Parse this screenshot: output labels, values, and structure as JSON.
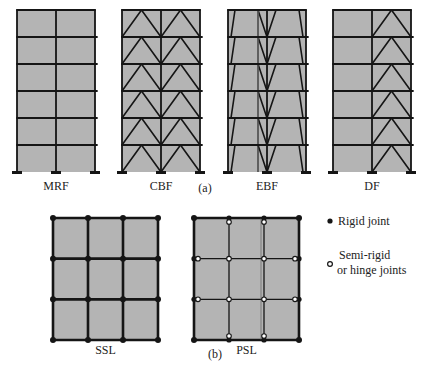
{
  "colors": {
    "panel_fill": "#b4b4b4",
    "member": "#151515",
    "rigid_joint": "#151515",
    "hinge_joint_fill": "#ffffff"
  },
  "part_a": {
    "label": "(a)",
    "frames": [
      {
        "id": "mrf",
        "label": "MRF",
        "stories": 6,
        "bays": 2,
        "bracing": "none"
      },
      {
        "id": "cbf",
        "label": "CBF",
        "stories": 6,
        "bays": 2,
        "bracing": "chevron-both-bays"
      },
      {
        "id": "ebf",
        "label": "EBF",
        "stories": 6,
        "bays": 2,
        "bracing": "eccentric-v"
      },
      {
        "id": "df",
        "label": "DF",
        "stories": 6,
        "bays": 2,
        "bracing": "chevron-right-bay"
      }
    ]
  },
  "part_b": {
    "label": "(b)",
    "layouts": [
      {
        "id": "ssl",
        "label": "SSL",
        "grid": 3,
        "joint_type": "rigid"
      },
      {
        "id": "psl",
        "label": "PSL",
        "grid": 3,
        "joint_type": "partial"
      }
    ],
    "legend": {
      "rigid": "Rigid joint",
      "hinge_line1": "Semi-rigid",
      "hinge_line2": "or hinge joints"
    }
  }
}
